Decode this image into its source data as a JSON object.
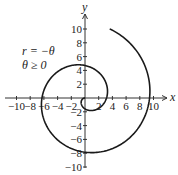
{
  "chart_data": {
    "type": "line",
    "title": "",
    "xlabel": "x",
    "ylabel": "y",
    "xlim": [
      -10,
      10
    ],
    "ylim": [
      -10,
      10
    ],
    "grid": false,
    "x_ticks": [
      "-10",
      "-8",
      "-6",
      "-4",
      "-2",
      "2",
      "4",
      "6",
      "8",
      "10"
    ],
    "y_ticks": [
      "10",
      "8",
      "6",
      "4",
      "2",
      "-2",
      "-4",
      "-6",
      "-8",
      "-10"
    ],
    "annotation": {
      "line1": "r = −θ",
      "line2": "θ ≥ 0"
    },
    "series": [
      {
        "name": "r = -theta (polar spiral)",
        "theta_range": [
          0,
          10.65
        ],
        "points": [
          [
            0,
            0
          ],
          [
            0,
            -1.57
          ],
          [
            3.14,
            0
          ],
          [
            0,
            4.71
          ],
          [
            -6.28,
            0
          ],
          [
            0,
            -7.85
          ],
          [
            9.42,
            0
          ],
          [
            4.1,
            9.8
          ]
        ]
      }
    ],
    "color": "#1a1a1a"
  }
}
